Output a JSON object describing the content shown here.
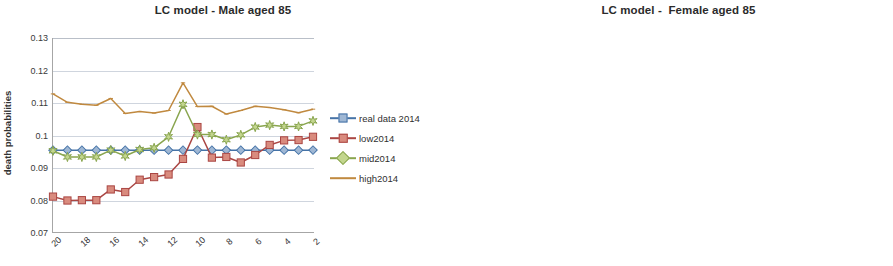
{
  "colors": {
    "real": "#4573a7",
    "low": "#aa4643",
    "mid": "#89a54e",
    "high": "#c0893f",
    "grid": "#cfd5de",
    "axis": "#a6a6a6",
    "text": "#3a3a3a"
  },
  "legend": {
    "items": [
      {
        "label": "real data 2014",
        "key": "real",
        "marker": "diamond"
      },
      {
        "label": "low2014",
        "key": "low",
        "marker": "square"
      },
      {
        "label": "mid2014",
        "key": "mid",
        "marker": "star"
      },
      {
        "label": "high2014",
        "key": "high",
        "marker": "line"
      }
    ]
  },
  "chart_data": [
    {
      "type": "line",
      "id": "male",
      "title": "LC model - Male aged 85",
      "xlabel": "",
      "ylabel": "death probabilities",
      "ylim": [
        0.07,
        0.13
      ],
      "yticks": [
        "0.07",
        "0.08",
        "0.09",
        "0.1",
        "0.11",
        "0.12",
        "0.13"
      ],
      "ytick_values": [
        0.07,
        0.08,
        0.09,
        0.1,
        0.11,
        0.12,
        0.13
      ],
      "grid": true,
      "legend_position": "right",
      "x": [
        20,
        19,
        18,
        17,
        16,
        15,
        14,
        13,
        12,
        11,
        10,
        9,
        8,
        7,
        6,
        5,
        4,
        3,
        2
      ],
      "xtick_labels": [
        "20",
        "18",
        "16",
        "14",
        "12",
        "10",
        "8",
        "6",
        "4",
        "2"
      ],
      "xtick_indices": [
        0,
        2,
        4,
        6,
        8,
        10,
        12,
        14,
        16,
        18
      ],
      "series": [
        {
          "name": "real data 2014",
          "key": "real",
          "values": [
            0.0955,
            0.0955,
            0.0955,
            0.0955,
            0.0955,
            0.0955,
            0.0955,
            0.0955,
            0.0955,
            0.0955,
            0.0955,
            0.0955,
            0.0955,
            0.0955,
            0.0955,
            0.0955,
            0.0955,
            0.0955,
            0.0955
          ]
        },
        {
          "name": "low2014",
          "key": "low",
          "values": [
            0.0812,
            0.08,
            0.0801,
            0.0801,
            0.0834,
            0.0826,
            0.0864,
            0.0872,
            0.088,
            0.0928,
            0.1026,
            0.0932,
            0.0934,
            0.0917,
            0.094,
            0.0971,
            0.0985,
            0.0986,
            0.0996,
            0.1015
          ]
        },
        {
          "name": "mid2014",
          "key": "mid",
          "values": [
            0.0953,
            0.0934,
            0.0934,
            0.0934,
            0.0955,
            0.0937,
            0.0957,
            0.0962,
            0.0996,
            0.1096,
            0.1003,
            0.1003,
            0.0987,
            0.1002,
            0.1026,
            0.1032,
            0.1028,
            0.1028,
            0.1045
          ]
        },
        {
          "name": "high2014",
          "key": "high",
          "values": [
            0.1128,
            0.1102,
            0.1096,
            0.1093,
            0.1114,
            0.1068,
            0.1074,
            0.1069,
            0.1077,
            0.1162,
            0.1089,
            0.109,
            0.1066,
            0.1077,
            0.109,
            0.1086,
            0.1079,
            0.107,
            0.1081
          ]
        }
      ]
    },
    {
      "type": "line",
      "id": "female",
      "title": "LC model -  Female aged 85",
      "xlabel": "",
      "ylabel": "death probabilities",
      "ylim": [
        0.04,
        0.09
      ],
      "yticks": [
        "0.04",
        "0.05",
        "0.06",
        "0.07",
        "0.08",
        "0.09"
      ],
      "ytick_values": [
        0.04,
        0.05,
        0.06,
        0.07,
        0.08,
        0.09
      ],
      "grid": true,
      "legend_position": "right",
      "x": [
        20,
        19,
        18,
        17,
        16,
        15,
        14,
        13,
        12,
        11,
        10,
        9,
        8,
        7,
        6,
        5,
        4,
        3,
        2
      ],
      "xtick_labels": [
        "20",
        "18",
        "16",
        "14",
        "12",
        "10",
        "8",
        "6",
        "4",
        "2"
      ],
      "xtick_indices": [
        0,
        2,
        4,
        6,
        8,
        10,
        12,
        14,
        16,
        18
      ],
      "series": [
        {
          "name": "real data 2014",
          "key": "real",
          "values": [
            0.0651,
            0.0651,
            0.0651,
            0.0651,
            0.0651,
            0.0651,
            0.0651,
            0.0651,
            0.0651,
            0.0651,
            0.0651,
            0.0651,
            0.0651,
            0.0651,
            0.0651,
            0.0651,
            0.0651,
            0.0651,
            0.0651
          ]
        },
        {
          "name": "low2014",
          "key": "low",
          "values": [
            0.051,
            0.049,
            0.05,
            0.0512,
            0.0531,
            0.0517,
            0.0541,
            0.0525,
            0.0562,
            0.0654,
            0.0539,
            0.055,
            0.0537,
            0.0553,
            0.0585,
            0.0601,
            0.0602,
            0.0624,
            0.0652
          ]
        },
        {
          "name": "mid2014",
          "key": "mid",
          "values": [
            0.0635,
            0.0613,
            0.0623,
            0.0643,
            0.065,
            0.0629,
            0.0638,
            0.0615,
            0.0629,
            0.0726,
            0.062,
            0.0637,
            0.0618,
            0.063,
            0.066,
            0.0668,
            0.0663,
            0.0677,
            0.0695
          ]
        },
        {
          "name": "high2014",
          "key": "high",
          "values": [
            0.0799,
            0.0773,
            0.078,
            0.0797,
            0.082,
            0.0766,
            0.0767,
            0.0721,
            0.0714,
            0.0812,
            0.0719,
            0.0744,
            0.0717,
            0.0727,
            0.0746,
            0.0743,
            0.073,
            0.0735,
            0.0743
          ]
        }
      ]
    }
  ]
}
